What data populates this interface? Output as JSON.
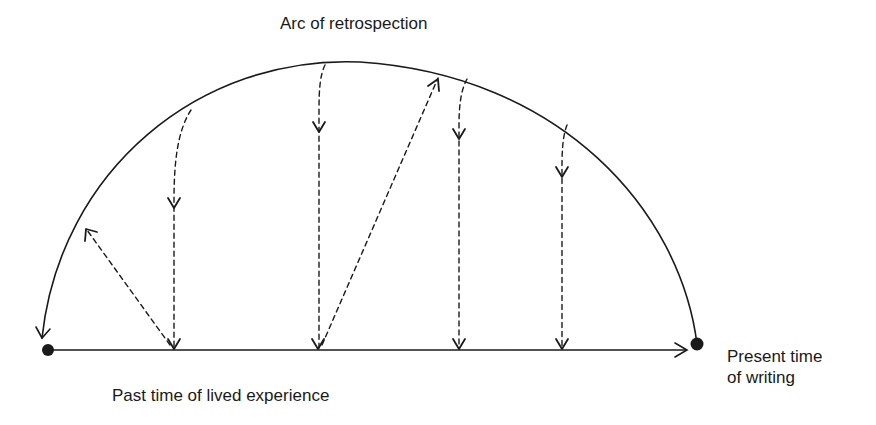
{
  "diagram": {
    "title": "Arc of retrospection",
    "baseline_label": "Past time of lived experience",
    "endpoint_label": {
      "line1": "Present time",
      "line2": "of writing"
    },
    "colors": {
      "stroke": "#1a1a1a",
      "background": "#ffffff"
    },
    "elements": {
      "arc": "solid arc from present (right dot) curving back to past (left dot), arrowhead at left end",
      "timeline": "solid horizontal line from left dot to right, arrowhead pointing right",
      "dashed_arrows": [
        {
          "from": "arc",
          "to": "timeline",
          "direction": "down"
        },
        {
          "from": "timeline",
          "to": "arc",
          "direction": "up-left"
        },
        {
          "from": "arc",
          "to": "timeline",
          "direction": "down"
        },
        {
          "from": "timeline",
          "to": "arc",
          "direction": "up-right"
        },
        {
          "from": "arc",
          "to": "timeline",
          "direction": "down"
        },
        {
          "from": "arc",
          "to": "timeline",
          "direction": "down"
        }
      ]
    }
  }
}
